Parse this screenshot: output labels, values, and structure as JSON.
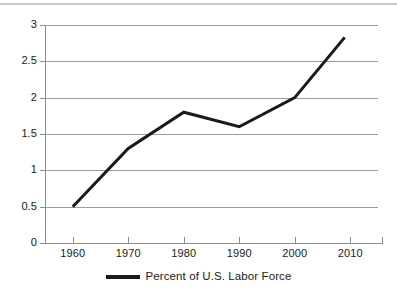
{
  "chart_data": {
    "type": "line",
    "title": "",
    "subtitle": "",
    "xlabel": "",
    "ylabel": "",
    "x": [
      1960,
      1970,
      1980,
      1990,
      2000,
      2009
    ],
    "categories": [
      "1960",
      "1970",
      "1980",
      "1990",
      "2000",
      "2010"
    ],
    "series": [
      {
        "name": "Percent of U.S. Labor Force",
        "values": [
          0.5,
          1.3,
          1.8,
          1.6,
          2.0,
          2.83
        ],
        "color": "#1a1a1a",
        "line_width": 3
      }
    ],
    "xlim": [
      1955,
      2015
    ],
    "ylim": [
      0,
      3
    ],
    "y_ticks": [
      "3",
      "2.5",
      "2",
      "1.5",
      "1",
      "0.5",
      "0"
    ],
    "y_tick_values": [
      3,
      2.5,
      2,
      1.5,
      1,
      0.5,
      0
    ],
    "x_ticks": [
      "1960",
      "1970",
      "1980",
      "1990",
      "2000",
      "2010"
    ],
    "x_tick_values": [
      1960,
      1970,
      1980,
      1990,
      2000,
      2010
    ],
    "grid": "horizontal",
    "legend_position": "bottom",
    "legend": [
      "Percent of U.S. Labor Force"
    ],
    "annotations": []
  },
  "colors": {
    "series": "#1a1a1a",
    "grid": "#9a9a9a",
    "axis": "#8c8c8c",
    "background": "#ffffff",
    "top_rule": "#c8c8cc"
  },
  "legend": {
    "label": "Percent of U.S. Labor Force"
  }
}
